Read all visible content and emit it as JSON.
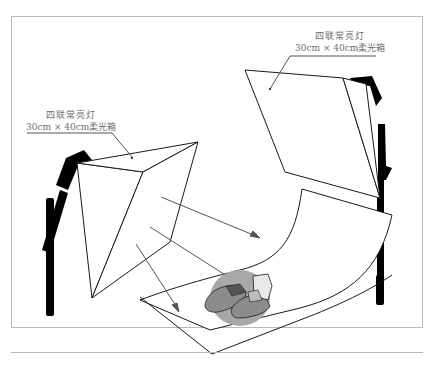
{
  "diagram": {
    "title": "",
    "labels": {
      "right_light": {
        "line1": "四联常亮灯",
        "line2": "30cm × 40cm柔光箱"
      },
      "left_light": {
        "line1": "四联常亮灯",
        "line2": "30cm × 40cm柔光箱"
      }
    },
    "elements": [
      "left softbox light on stand",
      "right softbox light on stand",
      "curved white backdrop sweep",
      "light direction arrows",
      "pair of sneakers with gray shadow"
    ],
    "colors": {
      "stroke": "#1a1a1a",
      "stand": "#000000",
      "arrow": "#555555",
      "shadow": "#a8a8a8",
      "label_text": "#6f6f6f",
      "frame": "#b9b9b9"
    }
  }
}
